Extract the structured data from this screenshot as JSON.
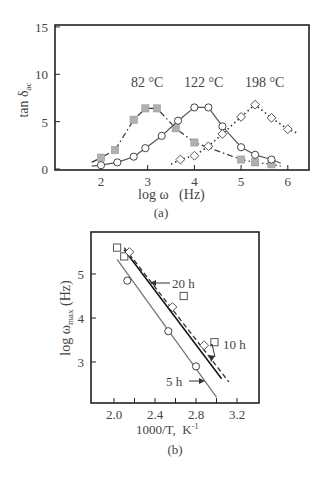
{
  "chart_data": [
    {
      "type": "line",
      "panel_label": "(a)",
      "title": "",
      "xlabel": "log ω   (Hz)",
      "ylabel": "tan δ",
      "ylabel_sub": "ac",
      "xlim": [
        1.0,
        6.5
      ],
      "ylim": [
        0,
        15
      ],
      "xticks": [
        "2",
        "3",
        "4",
        "5",
        "6"
      ],
      "yticks": [
        "0",
        "5",
        "10",
        "15"
      ],
      "grid": false,
      "annotations": [
        "82 °C",
        "122 °C",
        "198 °C"
      ],
      "series": [
        {
          "name": "82 °C",
          "marker": "filled-grey-square",
          "line": "dash-dot",
          "x": [
            2.0,
            2.3,
            2.7,
            2.95,
            3.2,
            3.6,
            4.0,
            5.0,
            5.3,
            5.65
          ],
          "y": [
            1.2,
            2.0,
            5.2,
            6.4,
            6.4,
            4.3,
            2.8,
            1.0,
            0.7,
            0.5
          ]
        },
        {
          "name": "122 °C",
          "marker": "open-circle",
          "line": "solid",
          "x": [
            2.0,
            2.35,
            2.7,
            2.95,
            3.3,
            3.65,
            4.0,
            4.3,
            4.6,
            5.0,
            5.3,
            5.65
          ],
          "y": [
            0.4,
            0.7,
            1.3,
            2.2,
            3.5,
            5.1,
            6.5,
            6.5,
            4.5,
            2.3,
            1.5,
            1.0
          ]
        },
        {
          "name": "198 °C",
          "marker": "open-diamond",
          "line": "dotted",
          "x": [
            3.7,
            4.0,
            4.3,
            4.6,
            5.0,
            5.3,
            5.65,
            6.0
          ],
          "y": [
            1.0,
            1.4,
            2.4,
            3.7,
            5.5,
            6.8,
            5.4,
            4.2
          ]
        }
      ]
    },
    {
      "type": "scatter",
      "panel_label": "(b)",
      "title": "",
      "xlabel": "1000/T,  K",
      "xlabel_sup": "-1",
      "ylabel": "log ω",
      "ylabel_sub": "max",
      "ylabel_unit": " (Hz)",
      "xlim": [
        1.78,
        3.35
      ],
      "ylim": [
        2.05,
        5.95
      ],
      "xticks": [
        "2.0",
        "2.4",
        "2.8",
        "3.2"
      ],
      "yticks": [
        "3",
        "4",
        "5"
      ],
      "grid": false,
      "annotations": [
        "20 h",
        "10 h",
        "5 h"
      ],
      "series": [
        {
          "name": "20 h",
          "marker": "open-square",
          "line": "dashed",
          "x": [
            2.03,
            2.1,
            2.68,
            2.98
          ],
          "y": [
            5.6,
            5.4,
            4.5,
            3.45
          ],
          "fit": {
            "x": [
              2.1,
              3.12
            ],
            "y": [
              5.6,
              2.55
            ]
          }
        },
        {
          "name": "10 h",
          "marker": "open-diamond",
          "line": "solid",
          "x": [
            2.15,
            2.57,
            2.88
          ],
          "y": [
            5.5,
            4.25,
            3.38
          ],
          "fit": {
            "x": [
              2.1,
              3.05
            ],
            "y": [
              5.55,
              2.62
            ]
          }
        },
        {
          "name": "5 h",
          "marker": "open-circle",
          "line": "solid-grey",
          "x": [
            2.13,
            2.53,
            2.8
          ],
          "y": [
            4.85,
            3.7,
            2.9
          ],
          "fit": {
            "x": [
              2.03,
              3.0
            ],
            "y": [
              5.33,
              2.2
            ]
          }
        }
      ]
    }
  ]
}
